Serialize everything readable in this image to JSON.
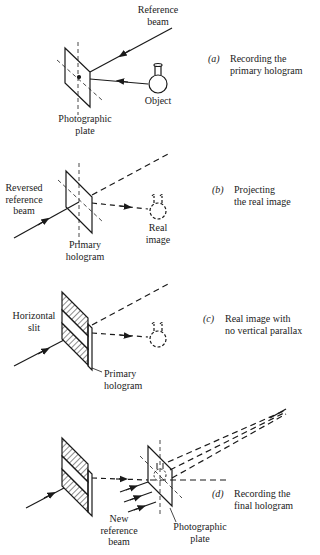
{
  "panels": [
    {
      "id": "a",
      "caption": {
        "tag": "(a)",
        "line1": "Recording the",
        "line2": "primary hologram"
      },
      "labels": {
        "reference_beam": "Reference\nbeam",
        "object": "Object",
        "plate": "Photographic\nplate"
      }
    },
    {
      "id": "b",
      "caption": {
        "tag": "(b)",
        "line1": "Projecting",
        "line2": "the real image"
      },
      "labels": {
        "reversed_beam": "Reversed\nreference\nbeam",
        "real_image": "Real\nimage",
        "primary": "Primary\nhologram"
      }
    },
    {
      "id": "c",
      "caption": {
        "tag": "(c)",
        "line1": "Real image with",
        "line2": "no vertical parallax"
      },
      "labels": {
        "slit": "Horizontal\nslit",
        "primary": "Primary\nhologram"
      }
    },
    {
      "id": "d",
      "caption": {
        "tag": "(d)",
        "line1": "Recording the",
        "line2": "final hologram"
      },
      "labels": {
        "new_beam": "New\nreference\nbeam",
        "plate": "Photographic\nplate"
      }
    }
  ],
  "colors": {
    "ink": "#1a1a1a",
    "background": "#ffffff"
  }
}
